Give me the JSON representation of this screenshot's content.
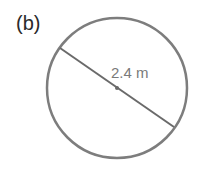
{
  "figure": {
    "label": "(b)",
    "shape": "circle",
    "dimension_label": "2.4 m",
    "dimension_type": "diameter",
    "stroke_color": "#7d7d7d"
  }
}
